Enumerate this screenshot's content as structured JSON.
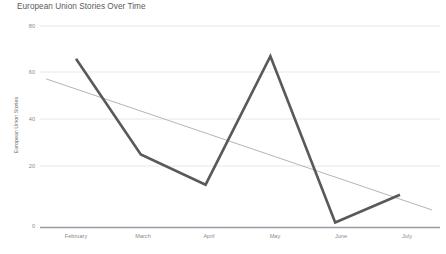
{
  "chart_data": {
    "type": "line",
    "title": "European Union Stories Over Time",
    "xlabel": "",
    "ylabel": "European Union Stories",
    "categories": [
      "February",
      "March",
      "April",
      "May",
      "June",
      "July"
    ],
    "values": [
      67,
      29,
      17,
      68,
      2,
      13
    ],
    "series": [
      {
        "name": "European Union Stories",
        "values": [
          67,
          29,
          17,
          68,
          2,
          13
        ],
        "color": "#595959",
        "style": "solid"
      },
      {
        "name": "Trendline",
        "values": [
          59,
          49,
          38,
          28,
          18,
          7
        ],
        "color": "#b5b5b5",
        "style": "linear-trend"
      }
    ],
    "yticks": [
      0,
      20,
      40,
      60,
      80
    ],
    "ytick_labels": [
      "0",
      "20",
      "40",
      "60",
      "80"
    ],
    "ylim": [
      0,
      80
    ],
    "xlim": [
      0,
      5
    ],
    "grid": true,
    "grid_color": "#e8e8ee",
    "legend": "none",
    "axis_color": "#9a9aa5"
  }
}
